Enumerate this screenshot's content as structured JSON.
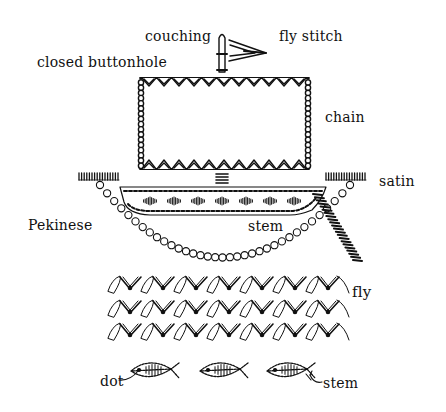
{
  "diagram": {
    "colors": {
      "ink": "#111111",
      "background": "#ffffff"
    },
    "labels": {
      "couching": "couching",
      "fly_stitch": "fly stitch",
      "closed_buttonhole": "closed buttonhole",
      "chain": "chain",
      "satin": "satin",
      "pekinese": "Pekinese",
      "stem_hull": "stem",
      "fly": "fly",
      "dot": "dot",
      "stem_fish": "stem"
    },
    "parts": {
      "mast": "couching",
      "flag": "fly stitch",
      "sail_top_bottom": "closed buttonhole",
      "sail_sides": "chain",
      "hull_outline": "stem",
      "hull_fill": "satin",
      "rope_posts": "satin",
      "rope": "Pekinese",
      "anchor_line": "satin",
      "waves": "fly",
      "fish_eye": "dot",
      "fish_outline": "stem"
    },
    "wave_rows": 3,
    "fish_count": 3
  }
}
